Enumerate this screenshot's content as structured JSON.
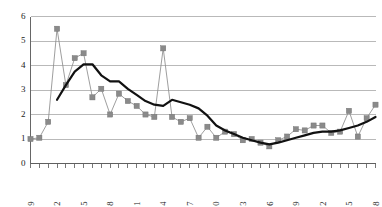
{
  "chart_data": {
    "type": "line",
    "title": "",
    "subtitle": "",
    "xlabel": "",
    "ylabel": "",
    "xlim": [
      1949,
      1988
    ],
    "ylim": [
      0,
      6
    ],
    "grid": true,
    "grid_axis": "y",
    "legend": false,
    "legend_position": "none",
    "x": [
      1949,
      1950,
      1951,
      1952,
      1953,
      1954,
      1955,
      1956,
      1957,
      1958,
      1959,
      1960,
      1961,
      1962,
      1963,
      1964,
      1965,
      1966,
      1967,
      1968,
      1969,
      1970,
      1971,
      1972,
      1973,
      1974,
      1975,
      1976,
      1977,
      1978,
      1979,
      1980,
      1981,
      1982,
      1983,
      1984,
      1985,
      1986,
      1987,
      1988
    ],
    "x_tick_labels": [
      "1949",
      "1952",
      "1955",
      "1958",
      "1961",
      "1964",
      "1967",
      "1970",
      "1973",
      "1976",
      "1979",
      "1982",
      "1985",
      "1988"
    ],
    "x_tick_label_values": [
      1949,
      1952,
      1955,
      1958,
      1961,
      1964,
      1967,
      1970,
      1973,
      1976,
      1979,
      1982,
      1985,
      1988
    ],
    "x_tick_label_rotation": -90,
    "x_minor_ticks_every": 1,
    "y_tick_labels": [
      "0",
      "1",
      "2",
      "3",
      "4",
      "5",
      "6"
    ],
    "y_tick_values": [
      0,
      1,
      2,
      3,
      4,
      5,
      6
    ],
    "series": [
      {
        "name": "annual-series",
        "style": "line-with-square-markers",
        "color": "#8a8a8a",
        "marker": "square",
        "values": [
          1.0,
          1.05,
          1.7,
          5.5,
          3.2,
          4.3,
          4.5,
          2.7,
          3.05,
          2.0,
          2.85,
          2.55,
          2.35,
          2.0,
          1.9,
          4.7,
          1.9,
          1.7,
          1.85,
          1.05,
          1.5,
          1.05,
          1.3,
          1.2,
          0.95,
          1.0,
          0.85,
          0.7,
          0.95,
          1.1,
          1.4,
          1.35,
          1.55,
          1.55,
          1.25,
          1.3,
          2.15,
          1.1,
          1.85,
          2.4
        ]
      },
      {
        "name": "smoothed-trend",
        "style": "thick-line",
        "color": "#111111",
        "marker": "none",
        "start_year": 1952,
        "values": [
          null,
          null,
          null,
          2.6,
          3.2,
          3.75,
          4.05,
          4.05,
          3.6,
          3.35,
          3.35,
          3.05,
          2.8,
          2.55,
          2.4,
          2.35,
          2.6,
          2.5,
          2.4,
          2.25,
          1.95,
          1.55,
          1.35,
          1.2,
          1.05,
          0.95,
          0.85,
          0.78,
          0.85,
          0.95,
          1.05,
          1.15,
          1.25,
          1.3,
          1.3,
          1.35,
          1.45,
          1.55,
          1.7,
          1.9
        ]
      }
    ]
  },
  "colors": {
    "background": "#ffffff",
    "gridline": "#a8a8a8",
    "axis": "#555555",
    "series_raw": "#8a8a8a",
    "series_smooth": "#111111",
    "text": "#222222"
  }
}
